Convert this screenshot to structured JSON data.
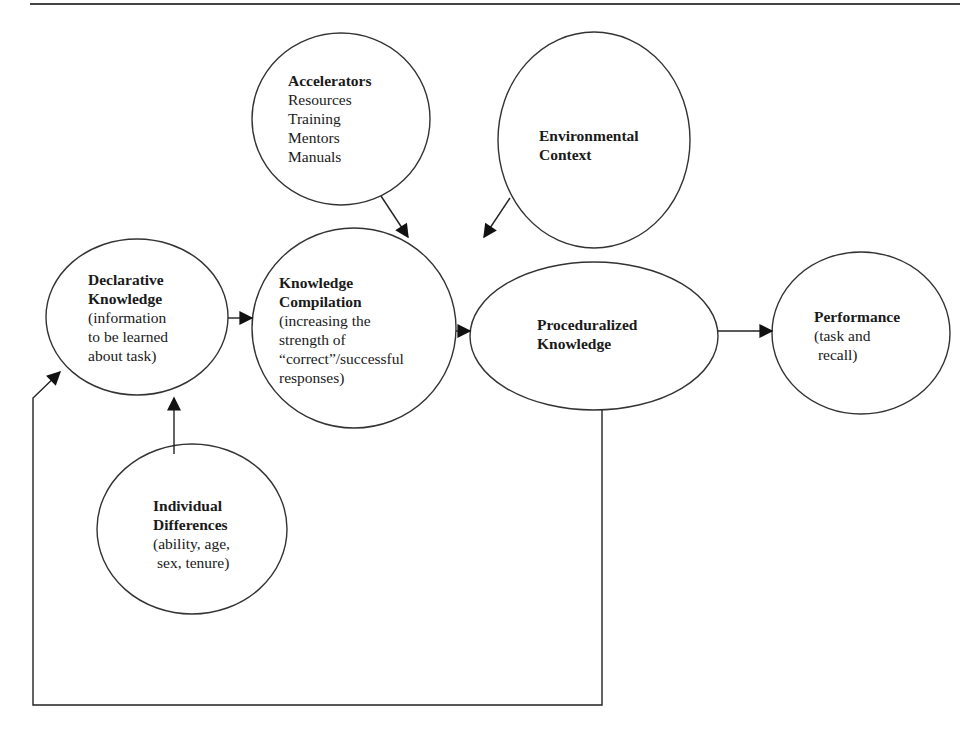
{
  "diagram": {
    "type": "flow",
    "nodes": [
      {
        "id": "accelerators",
        "title": "Accelerators",
        "lines": [
          "Resources",
          "Training",
          "Mentors",
          "Manuals"
        ]
      },
      {
        "id": "environmental_context",
        "title_lines": [
          "Environmental",
          "Context"
        ],
        "lines": []
      },
      {
        "id": "declarative_knowledge",
        "title_lines": [
          "Declarative",
          "Knowledge"
        ],
        "lines": [
          "(information",
          "to be learned",
          "about task)"
        ]
      },
      {
        "id": "knowledge_compilation",
        "title_lines": [
          "Knowledge",
          "Compilation"
        ],
        "lines": [
          "(increasing the",
          "strength of",
          "“correct”/successful",
          "responses)"
        ]
      },
      {
        "id": "proceduralized_knowledge",
        "title_lines": [
          "Proceduralized",
          "Knowledge"
        ],
        "lines": []
      },
      {
        "id": "performance",
        "title": "Performance",
        "lines": [
          "(task and",
          " recall)"
        ]
      },
      {
        "id": "individual_differences",
        "title_lines": [
          "Individual",
          "Differences"
        ],
        "lines": [
          "(ability, age,",
          "sex, tenure)"
        ]
      }
    ],
    "edges": [
      {
        "from": "declarative_knowledge",
        "to": "knowledge_compilation"
      },
      {
        "from": "knowledge_compilation",
        "to": "proceduralized_knowledge"
      },
      {
        "from": "proceduralized_knowledge",
        "to": "performance"
      },
      {
        "from": "accelerators",
        "to": "knowledge_compilation"
      },
      {
        "from": "environmental_context",
        "to": "proceduralized_knowledge"
      },
      {
        "from": "individual_differences",
        "to": "declarative_knowledge"
      },
      {
        "from": "proceduralized_knowledge",
        "to": "declarative_knowledge",
        "style": "feedback-loop"
      }
    ]
  },
  "colors": {
    "stroke": "#333333",
    "text": "#1a1a1a",
    "background": "#ffffff"
  }
}
